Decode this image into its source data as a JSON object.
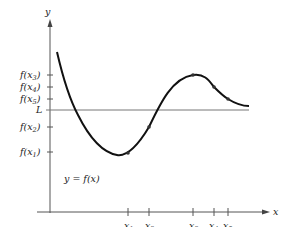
{
  "diagram": {
    "axes": {
      "x_label": "x",
      "y_label": "y"
    },
    "function_label": "y = f(x)",
    "limit_line_label": "L",
    "x_points": [
      {
        "base": "x",
        "sub": "1"
      },
      {
        "base": "x",
        "sub": "2"
      },
      {
        "base": "x",
        "sub": "3"
      },
      {
        "base": "x",
        "sub": "4"
      },
      {
        "base": "x",
        "sub": "5"
      }
    ],
    "y_ticks": [
      {
        "pre": "f(x",
        "sub": "3",
        "post": ")"
      },
      {
        "pre": "f(x",
        "sub": "4",
        "post": ")"
      },
      {
        "pre": "f(x",
        "sub": "5",
        "post": ")"
      },
      {
        "pre": "f(x",
        "sub": "2",
        "post": ")"
      },
      {
        "pre": "f(x",
        "sub": "1",
        "post": ")"
      }
    ],
    "colors": {
      "curve": "#111111",
      "axis": "#555555",
      "limit_line": "#777777",
      "point": "#333333"
    }
  }
}
